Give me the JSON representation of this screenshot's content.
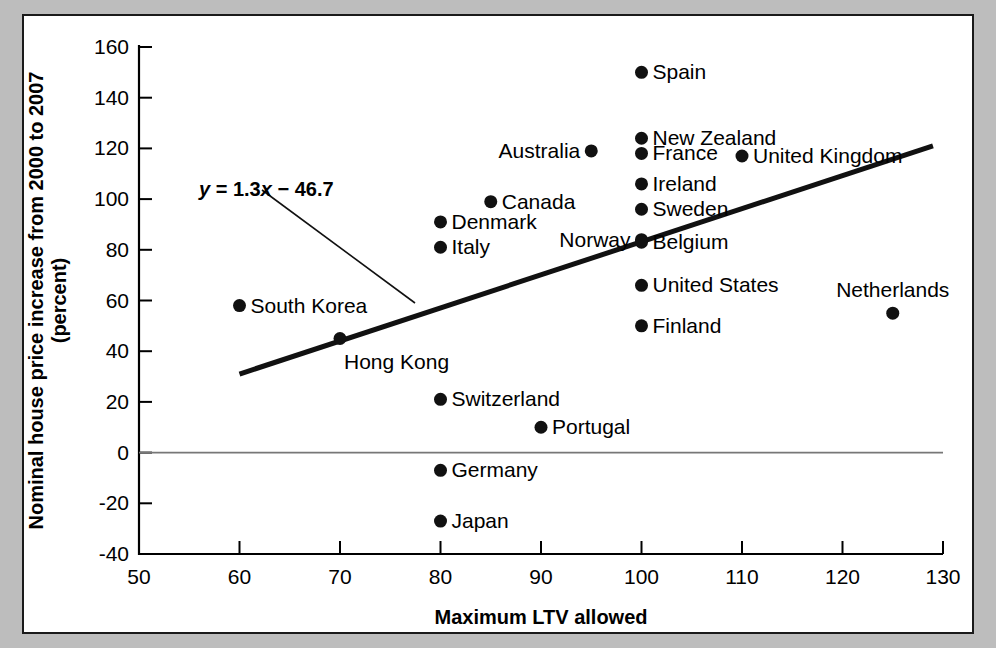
{
  "chart_data": {
    "type": "scatter",
    "title": "",
    "xlabel": "Maximum LTV allowed",
    "ylabel": "Nominal house price increase from 2000 to 2007 (percent)",
    "ylabel_line1": "Nominal house price increase from 2000 to 2007",
    "ylabel_line2": "(percent)",
    "xlim": [
      50,
      130
    ],
    "ylim": [
      -40,
      160
    ],
    "xticks": [
      50,
      60,
      70,
      80,
      90,
      100,
      110,
      120,
      130
    ],
    "yticks": [
      -40,
      -20,
      0,
      20,
      40,
      60,
      80,
      100,
      120,
      140,
      160
    ],
    "grid": false,
    "legend": false,
    "zero_line": true,
    "annotation": {
      "equation": "y = 1.3x − 46.7",
      "eq_part_y": "y",
      "eq_part_mid": " = 1.3",
      "eq_part_x": "x",
      "eq_part_end": " − 46.7",
      "slope": 1.3,
      "intercept": -46.7
    },
    "trendline": {
      "x_start": 60,
      "y_start": 31,
      "x_end": 129,
      "y_end": 121
    },
    "points": [
      {
        "name": "Spain",
        "x": 100,
        "y": 150,
        "label_pos": "right"
      },
      {
        "name": "New Zealand",
        "x": 100,
        "y": 124,
        "label_pos": "right"
      },
      {
        "name": "France",
        "x": 100,
        "y": 118,
        "label_pos": "right"
      },
      {
        "name": "United Kingdom",
        "x": 110,
        "y": 117,
        "label_pos": "right"
      },
      {
        "name": "Australia",
        "x": 95,
        "y": 119,
        "label_pos": "left"
      },
      {
        "name": "Ireland",
        "x": 100,
        "y": 106,
        "label_pos": "right"
      },
      {
        "name": "Canada",
        "x": 85,
        "y": 99,
        "label_pos": "right"
      },
      {
        "name": "Sweden",
        "x": 100,
        "y": 96,
        "label_pos": "right"
      },
      {
        "name": "Denmark",
        "x": 80,
        "y": 91,
        "label_pos": "right"
      },
      {
        "name": "Norway",
        "x": 100,
        "y": 84,
        "label_pos": "left"
      },
      {
        "name": "Belgium",
        "x": 100,
        "y": 83,
        "label_pos": "right"
      },
      {
        "name": "Italy",
        "x": 80,
        "y": 81,
        "label_pos": "right"
      },
      {
        "name": "United States",
        "x": 100,
        "y": 66,
        "label_pos": "right"
      },
      {
        "name": "South Korea",
        "x": 60,
        "y": 58,
        "label_pos": "right"
      },
      {
        "name": "Netherlands",
        "x": 125,
        "y": 55,
        "label_pos": "above"
      },
      {
        "name": "Finland",
        "x": 100,
        "y": 50,
        "label_pos": "right"
      },
      {
        "name": "Hong Kong",
        "x": 70,
        "y": 45,
        "label_pos": "below-right"
      },
      {
        "name": "Switzerland",
        "x": 80,
        "y": 21,
        "label_pos": "right"
      },
      {
        "name": "Portugal",
        "x": 90,
        "y": 10,
        "label_pos": "right"
      },
      {
        "name": "Germany",
        "x": 80,
        "y": -7,
        "label_pos": "right"
      },
      {
        "name": "Japan",
        "x": 80,
        "y": -27,
        "label_pos": "right"
      }
    ]
  },
  "colors": {
    "background": "#bdbdbd",
    "panel": "#ffffff",
    "ink": "#111111",
    "zero_line": "#777777"
  }
}
